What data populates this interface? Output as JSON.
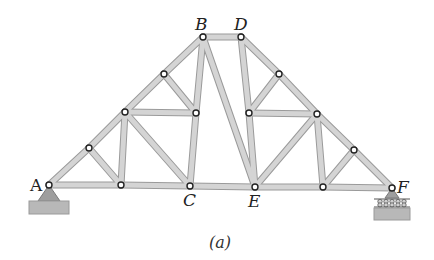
{
  "figure": {
    "caption": "(a)",
    "colors": {
      "member_fill": "#d4d4d4",
      "member_edge": "#9a9a9a",
      "joint_fill": "#ffffff",
      "joint_edge": "#222222",
      "support_fill": "#9e9e9e",
      "ground_fill": "#b8b8b8",
      "label": "#222222"
    },
    "labels": [
      {
        "id": "A",
        "text": "A",
        "x": 30,
        "y": 191,
        "upright": true
      },
      {
        "id": "B",
        "text": "B",
        "x": 195,
        "y": 30,
        "upright": false
      },
      {
        "id": "D",
        "text": "D",
        "x": 234,
        "y": 30,
        "upright": false
      },
      {
        "id": "C",
        "text": "C",
        "x": 183,
        "y": 206,
        "upright": false
      },
      {
        "id": "E",
        "text": "E",
        "x": 248,
        "y": 207,
        "upright": false
      },
      {
        "id": "F",
        "text": "F",
        "x": 397,
        "y": 193,
        "upright": false
      }
    ],
    "joints": [
      {
        "id": "A",
        "x": 49,
        "y": 185
      },
      {
        "id": "L1",
        "x": 89,
        "y": 148
      },
      {
        "id": "L2",
        "x": 125,
        "y": 112
      },
      {
        "id": "L3",
        "x": 164,
        "y": 74
      },
      {
        "id": "B",
        "x": 203,
        "y": 37
      },
      {
        "id": "D",
        "x": 241,
        "y": 37
      },
      {
        "id": "R3",
        "x": 279,
        "y": 74
      },
      {
        "id": "R2",
        "x": 317,
        "y": 114
      },
      {
        "id": "R1",
        "x": 354,
        "y": 150
      },
      {
        "id": "F",
        "x": 392,
        "y": 188
      },
      {
        "id": "B1",
        "x": 121,
        "y": 185
      },
      {
        "id": "C",
        "x": 190,
        "y": 186
      },
      {
        "id": "E",
        "x": 255,
        "y": 187
      },
      {
        "id": "B4",
        "x": 323,
        "y": 187
      },
      {
        "id": "IL",
        "x": 196,
        "y": 113
      },
      {
        "id": "IR",
        "x": 249,
        "y": 113
      }
    ],
    "members": [
      [
        "A",
        "L1"
      ],
      [
        "L1",
        "L2"
      ],
      [
        "L2",
        "L3"
      ],
      [
        "L3",
        "B"
      ],
      [
        "B",
        "D"
      ],
      [
        "D",
        "R3"
      ],
      [
        "R3",
        "R2"
      ],
      [
        "R2",
        "R1"
      ],
      [
        "R1",
        "F"
      ],
      [
        "A",
        "B1"
      ],
      [
        "B1",
        "C"
      ],
      [
        "C",
        "E"
      ],
      [
        "E",
        "B4"
      ],
      [
        "B4",
        "F"
      ],
      [
        "L1",
        "B1"
      ],
      [
        "L2",
        "B1"
      ],
      [
        "L2",
        "C"
      ],
      [
        "L2",
        "IL"
      ],
      [
        "L3",
        "IL"
      ],
      [
        "B",
        "IL"
      ],
      [
        "IL",
        "C"
      ],
      [
        "B",
        "E"
      ],
      [
        "D",
        "IR"
      ],
      [
        "IR",
        "E"
      ],
      [
        "IR",
        "R3"
      ],
      [
        "IR",
        "R2"
      ],
      [
        "R2",
        "E"
      ],
      [
        "R2",
        "B4"
      ],
      [
        "R1",
        "B4"
      ]
    ],
    "supports": {
      "pin": {
        "joint": "A",
        "type": "pin"
      },
      "roller": {
        "joint": "F",
        "type": "roller"
      }
    }
  }
}
